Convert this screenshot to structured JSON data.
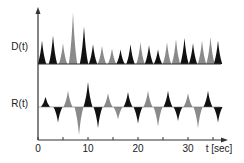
{
  "chart_data": {
    "type": "area",
    "title": "",
    "xlabel": "t [sec]",
    "x_ticks": [
      0,
      10,
      20,
      30
    ],
    "x_minor_ticks": [
      5,
      15,
      25,
      35
    ],
    "xlim": [
      0,
      37
    ],
    "grid": false,
    "legend": null,
    "colors": {
      "dark": "#111111",
      "light": "#8a8a8a",
      "axis": "#333333"
    },
    "series": [
      {
        "name": "D(t)",
        "label": "D(t)",
        "baseline": 0,
        "peaks": [
          {
            "t": 0.8,
            "h": 0.45,
            "shade": "dark"
          },
          {
            "t": 3.0,
            "h": 0.55,
            "shade": "dark"
          },
          {
            "t": 5.0,
            "h": 0.4,
            "shade": "light"
          },
          {
            "t": 7.0,
            "h": 1.0,
            "shade": "light"
          },
          {
            "t": 9.2,
            "h": 0.72,
            "shade": "dark"
          },
          {
            "t": 11.0,
            "h": 0.38,
            "shade": "dark"
          },
          {
            "t": 12.8,
            "h": 0.35,
            "shade": "light"
          },
          {
            "t": 14.8,
            "h": 0.3,
            "shade": "light"
          },
          {
            "t": 16.5,
            "h": 0.28,
            "shade": "dark"
          },
          {
            "t": 18.5,
            "h": 0.38,
            "shade": "dark"
          },
          {
            "t": 20.5,
            "h": 0.42,
            "shade": "light"
          },
          {
            "t": 22.2,
            "h": 0.36,
            "shade": "dark"
          },
          {
            "t": 24.0,
            "h": 0.28,
            "shade": "dark"
          },
          {
            "t": 25.8,
            "h": 0.42,
            "shade": "light"
          },
          {
            "t": 27.6,
            "h": 0.48,
            "shade": "light"
          },
          {
            "t": 29.3,
            "h": 0.5,
            "shade": "dark"
          },
          {
            "t": 31.0,
            "h": 0.4,
            "shade": "dark"
          },
          {
            "t": 32.8,
            "h": 0.45,
            "shade": "light"
          },
          {
            "t": 34.5,
            "h": 0.52,
            "shade": "light"
          },
          {
            "t": 36.0,
            "h": 0.45,
            "shade": "dark"
          }
        ]
      },
      {
        "name": "R(t)",
        "label": "R(t)",
        "baseline": 0,
        "peaks": [
          {
            "t": 1.5,
            "h": 0.4,
            "shade": "dark"
          },
          {
            "t": 4.0,
            "h": -0.55,
            "shade": "dark"
          },
          {
            "t": 6.0,
            "h": 0.65,
            "shade": "light"
          },
          {
            "t": 8.2,
            "h": -1.0,
            "shade": "light"
          },
          {
            "t": 10.0,
            "h": 1.0,
            "shade": "dark"
          },
          {
            "t": 12.0,
            "h": -0.75,
            "shade": "dark"
          },
          {
            "t": 14.0,
            "h": 0.55,
            "shade": "light"
          },
          {
            "t": 16.0,
            "h": -0.45,
            "shade": "light"
          },
          {
            "t": 18.0,
            "h": 0.6,
            "shade": "dark"
          },
          {
            "t": 20.0,
            "h": -0.6,
            "shade": "dark"
          },
          {
            "t": 22.0,
            "h": 0.65,
            "shade": "light"
          },
          {
            "t": 24.0,
            "h": -0.7,
            "shade": "light"
          },
          {
            "t": 26.0,
            "h": 0.65,
            "shade": "dark"
          },
          {
            "t": 28.0,
            "h": -0.5,
            "shade": "dark"
          },
          {
            "t": 30.0,
            "h": 0.55,
            "shade": "light"
          },
          {
            "t": 32.0,
            "h": -0.75,
            "shade": "light"
          },
          {
            "t": 34.0,
            "h": 0.65,
            "shade": "dark"
          },
          {
            "t": 36.0,
            "h": -0.55,
            "shade": "dark"
          }
        ]
      }
    ]
  },
  "labels": {
    "d_label": "D(t)",
    "r_label": "R(t)",
    "xaxis_label": "t [sec]",
    "tick_0": "0",
    "tick_10": "10",
    "tick_20": "20",
    "tick_30": "30"
  }
}
